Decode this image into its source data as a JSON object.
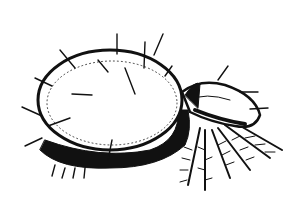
{
  "figure": {
    "style": "black-and-white pen-and-ink drawing",
    "colors": {
      "background": "#ffffff",
      "ink": "#111111"
    }
  }
}
